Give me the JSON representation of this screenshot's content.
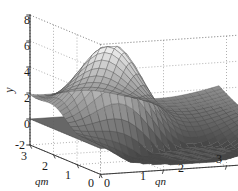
{
  "chart_data": {
    "type": "surface3d",
    "title": "",
    "xlabel": "qm",
    "ylabel": "qn",
    "zlabel": "y",
    "axes": {
      "qm": {
        "label": "qm",
        "ticks": [
          3,
          2,
          1,
          0
        ],
        "range": [
          0,
          3
        ],
        "reversed": true
      },
      "qn": {
        "label": "qn",
        "ticks": [
          0,
          1,
          2,
          3
        ],
        "range": [
          0,
          3
        ],
        "reversed": false
      },
      "y": {
        "label": "y",
        "ticks": [
          -2,
          0,
          2,
          4,
          6,
          8
        ],
        "range": [
          -2,
          8
        ]
      }
    },
    "grid": true,
    "grid_style": "dotted",
    "legend": "none",
    "surfaces": [
      {
        "name": "mesh-surface",
        "style": "wireframe-mesh",
        "colormap": "grayscale",
        "z_expr": "peak-and-valley",
        "z_min": -1.6,
        "z_max": 5.9,
        "corner_values": {
          "qm0_qn0": 0.0,
          "qm3_qn0": 4.0,
          "qm0_qn3": 3.0,
          "qm3_qn3": 3.1
        },
        "peak": {
          "qm": 1.9,
          "qn": 0.95,
          "y": 5.9
        },
        "valley": {
          "qm": 0.85,
          "qn": 1.5,
          "y": -1.6
        }
      },
      {
        "name": "zero-plane",
        "style": "filled-plane",
        "color": "#5a5a5a",
        "y": 0
      }
    ],
    "colors": {
      "axis": "#3a3a3a",
      "grid": "#7a7a7a",
      "mesh_line": "#4a4a4a",
      "plane_fill": "#5a5a5a",
      "text": "#1a1a1a",
      "background": "#ffffff"
    }
  },
  "labels": {
    "y_axis": "y",
    "qm_axis": "qm",
    "qn_axis": "qn",
    "y_ticks": [
      "8",
      "6",
      "4",
      "2",
      "0",
      "-2"
    ],
    "qm_ticks": [
      "3",
      "2",
      "1",
      "0"
    ],
    "qn_ticks": [
      "0",
      "1",
      "2",
      "3"
    ]
  }
}
